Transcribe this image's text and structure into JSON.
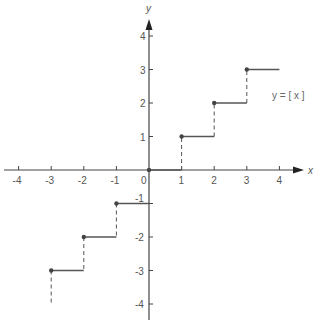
{
  "chart_data": {
    "type": "line",
    "title": "",
    "function_label": "y = [ x ]",
    "xlabel": "x",
    "ylabel": "y",
    "xlim": [
      -4,
      4
    ],
    "ylim": [
      -4,
      4
    ],
    "x_ticks": [
      -4,
      -3,
      -2,
      -1,
      0,
      1,
      2,
      3,
      4
    ],
    "y_ticks": [
      -4,
      -3,
      -2,
      -1,
      1,
      2,
      3,
      4
    ],
    "grid": false,
    "series": [
      {
        "name": "greatest integer function",
        "steps": [
          {
            "x_start": -3,
            "x_end": -2,
            "y": -3
          },
          {
            "x_start": -2,
            "x_end": -1,
            "y": -2
          },
          {
            "x_start": -1,
            "x_end": 0,
            "y": -1
          },
          {
            "x_start": 0,
            "x_end": 1,
            "y": 0
          },
          {
            "x_start": 1,
            "x_end": 2,
            "y": 1
          },
          {
            "x_start": 2,
            "x_end": 3,
            "y": 2
          },
          {
            "x_start": 3,
            "x_end": 4,
            "y": 3
          }
        ],
        "closed_points": [
          [
            -3,
            -3
          ],
          [
            -2,
            -2
          ],
          [
            -1,
            -1
          ],
          [
            0,
            0
          ],
          [
            1,
            1
          ],
          [
            2,
            2
          ],
          [
            3,
            3
          ]
        ]
      }
    ]
  },
  "labels": {
    "x_axis": "x",
    "y_axis": "y",
    "equation": "y = [ x ]",
    "origin": "0"
  }
}
